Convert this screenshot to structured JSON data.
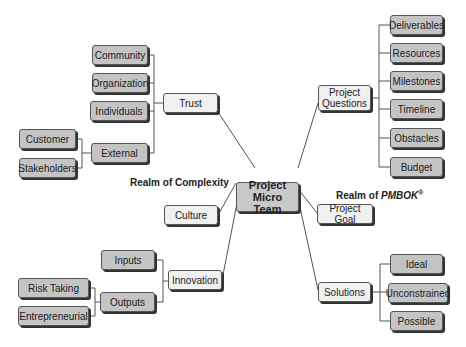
{
  "center": {
    "line1": "Project Micro",
    "line2": "Team"
  },
  "labels": {
    "complexity": "Realm of Complexity",
    "pmbok_prefix": "Realm of ",
    "pmbok_italic": "PMBOK",
    "pmbok_sup": "®"
  },
  "branches": {
    "trust": "Trust",
    "culture": "Culture",
    "innovation": "Innovation",
    "project_questions_1": "Project",
    "project_questions_2": "Questions",
    "project_goal": "Project Goal",
    "solutions": "Solutions"
  },
  "trust_children": [
    "Community",
    "Organization",
    "Individuals",
    "External"
  ],
  "external_children": [
    "Customer",
    "Stakeholders"
  ],
  "innovation_children": [
    "Inputs",
    "Outputs"
  ],
  "outputs_children": [
    "Risk Taking",
    "Entrepreneurial"
  ],
  "question_children": [
    "Deliverables",
    "Resources",
    "Milestones",
    "Timeline",
    "Obstacles",
    "Budget"
  ],
  "solution_children": [
    "Ideal",
    "Unconstrained",
    "Possible"
  ]
}
